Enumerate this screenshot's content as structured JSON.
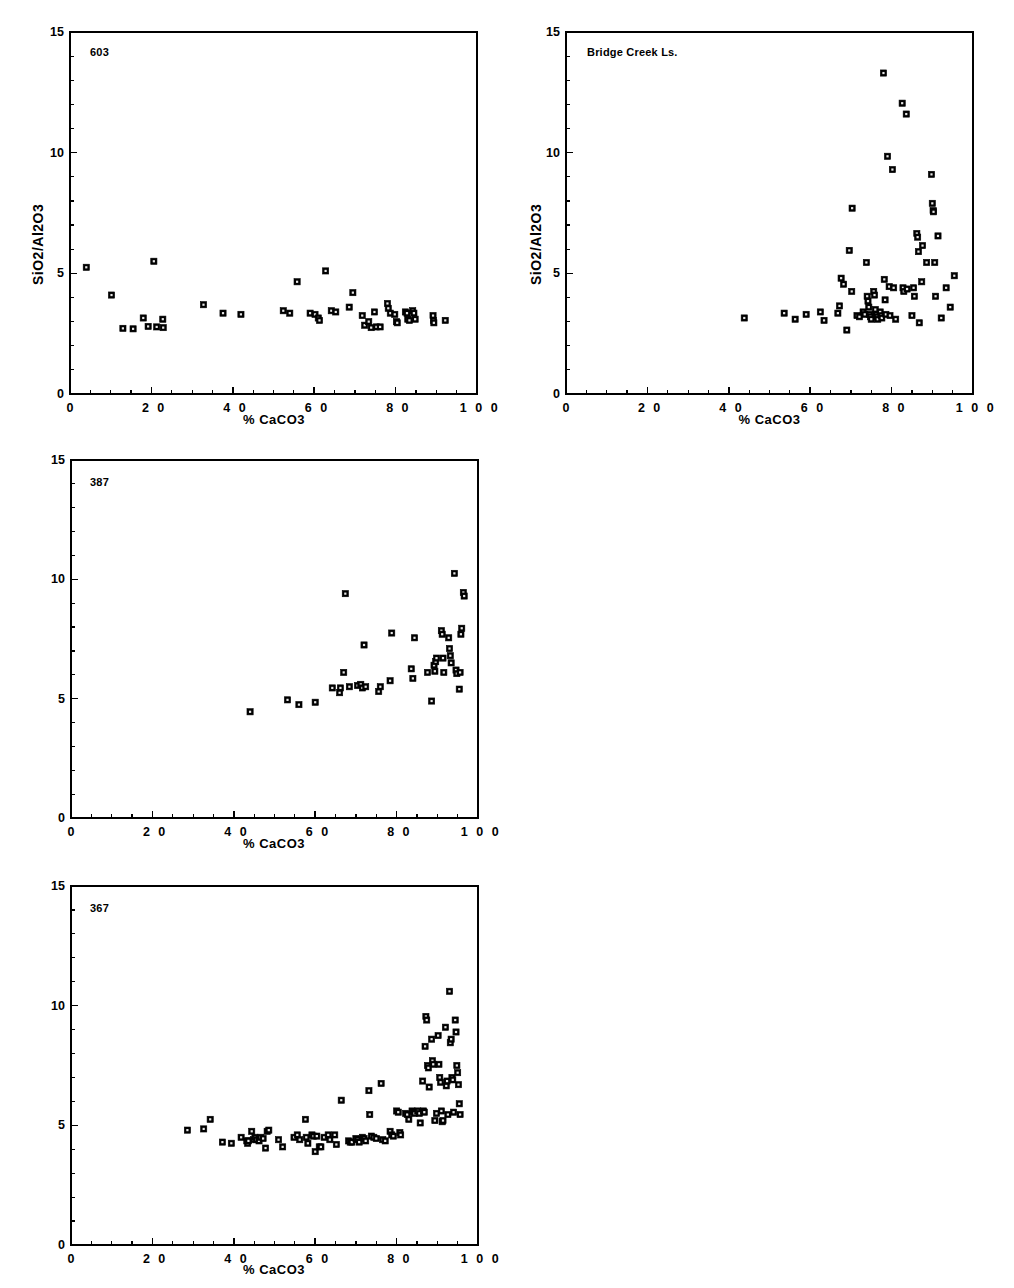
{
  "figure": {
    "background": "#ffffff",
    "marker_color": "#000000",
    "axis_color": "#000000",
    "clipped_top_text": ""
  },
  "axes_common": {
    "xlabel": "% CaCO3",
    "ylabel": "SiO2/Al2O3",
    "xlim": [
      0,
      100
    ],
    "ylim": [
      0,
      15
    ],
    "xticks_major": [
      0,
      20,
      40,
      60,
      80,
      100
    ],
    "xticks_major_labels": [
      "0",
      "2 0",
      "4 0",
      "6 0",
      "8 0",
      "1 0 0"
    ],
    "xtick_minor_step": 5,
    "yticks_major": [
      0,
      5,
      10,
      15
    ],
    "yticks_major_labels": [
      "0",
      "5",
      "10",
      "15"
    ],
    "ytick_minor_step": 1,
    "grid": false,
    "legend": "none"
  },
  "chart_data": [
    {
      "id": "panel-603",
      "type": "scatter",
      "title": "603",
      "xlabel": "% CaCO3",
      "ylabel": "SiO2/Al2O3",
      "xlim": [
        0,
        100
      ],
      "ylim": [
        0,
        15
      ],
      "marker": "square",
      "points": [
        [
          4.0,
          5.25
        ],
        [
          10.2,
          4.1
        ],
        [
          13.0,
          2.72
        ],
        [
          15.5,
          2.7
        ],
        [
          18.0,
          3.15
        ],
        [
          19.2,
          2.8
        ],
        [
          20.6,
          5.5
        ],
        [
          21.3,
          2.78
        ],
        [
          22.8,
          3.1
        ],
        [
          22.9,
          2.75
        ],
        [
          32.8,
          3.7
        ],
        [
          37.6,
          3.35
        ],
        [
          42.0,
          3.3
        ],
        [
          52.4,
          3.45
        ],
        [
          54.0,
          3.35
        ],
        [
          55.8,
          4.65
        ],
        [
          59.0,
          3.35
        ],
        [
          60.2,
          3.3
        ],
        [
          61.0,
          3.15
        ],
        [
          61.3,
          3.05
        ],
        [
          62.8,
          5.1
        ],
        [
          64.2,
          3.45
        ],
        [
          65.3,
          3.4
        ],
        [
          68.6,
          3.6
        ],
        [
          69.5,
          4.2
        ],
        [
          71.8,
          3.25
        ],
        [
          72.4,
          2.85
        ],
        [
          73.4,
          3.0
        ],
        [
          74.0,
          2.75
        ],
        [
          74.8,
          3.4
        ],
        [
          75.3,
          2.78
        ],
        [
          76.2,
          2.78
        ],
        [
          78.0,
          3.75
        ],
        [
          78.2,
          3.55
        ],
        [
          78.7,
          3.35
        ],
        [
          79.8,
          3.3
        ],
        [
          80.2,
          3.0
        ],
        [
          80.4,
          2.95
        ],
        [
          82.4,
          3.4
        ],
        [
          82.8,
          3.35
        ],
        [
          83.0,
          3.1
        ],
        [
          83.4,
          3.05
        ],
        [
          84.2,
          3.45
        ],
        [
          84.5,
          3.35
        ],
        [
          84.8,
          3.1
        ],
        [
          89.2,
          3.25
        ],
        [
          89.3,
          3.05
        ],
        [
          89.4,
          2.95
        ],
        [
          92.2,
          3.05
        ]
      ]
    },
    {
      "id": "panel-bridge-creek",
      "type": "scatter",
      "title": "Bridge Creek Ls.",
      "xlabel": "% CaCO3",
      "ylabel": "SiO2/Al2O3",
      "xlim": [
        0,
        100
      ],
      "ylim": [
        0,
        15
      ],
      "marker": "square",
      "points": [
        [
          43.8,
          3.15
        ],
        [
          53.6,
          3.35
        ],
        [
          56.3,
          3.1
        ],
        [
          59.0,
          3.3
        ],
        [
          62.5,
          3.4
        ],
        [
          63.4,
          3.05
        ],
        [
          66.8,
          3.35
        ],
        [
          67.2,
          3.65
        ],
        [
          67.6,
          4.8
        ],
        [
          68.2,
          4.55
        ],
        [
          69.0,
          2.65
        ],
        [
          69.6,
          5.95
        ],
        [
          70.2,
          4.25
        ],
        [
          70.3,
          7.7
        ],
        [
          71.5,
          3.25
        ],
        [
          72.1,
          3.2
        ],
        [
          73.0,
          3.4
        ],
        [
          73.4,
          3.3
        ],
        [
          73.8,
          5.45
        ],
        [
          74.0,
          4.05
        ],
        [
          74.2,
          3.85
        ],
        [
          74.4,
          3.6
        ],
        [
          74.6,
          3.3
        ],
        [
          74.8,
          3.2
        ],
        [
          75.0,
          3.1
        ],
        [
          75.6,
          4.25
        ],
        [
          75.8,
          4.1
        ],
        [
          76.0,
          3.5
        ],
        [
          76.2,
          3.3
        ],
        [
          76.4,
          3.2
        ],
        [
          76.6,
          3.1
        ],
        [
          77.2,
          3.4
        ],
        [
          77.4,
          3.25
        ],
        [
          77.6,
          3.15
        ],
        [
          78.0,
          13.3
        ],
        [
          78.2,
          4.75
        ],
        [
          78.4,
          3.9
        ],
        [
          78.6,
          3.3
        ],
        [
          79.0,
          9.85
        ],
        [
          79.4,
          4.45
        ],
        [
          79.6,
          3.25
        ],
        [
          80.2,
          9.3
        ],
        [
          80.5,
          4.4
        ],
        [
          81.0,
          3.1
        ],
        [
          82.6,
          12.05
        ],
        [
          82.8,
          4.4
        ],
        [
          83.0,
          4.25
        ],
        [
          83.6,
          11.6
        ],
        [
          83.8,
          4.35
        ],
        [
          85.0,
          3.25
        ],
        [
          85.4,
          4.4
        ],
        [
          85.6,
          4.05
        ],
        [
          86.2,
          6.65
        ],
        [
          86.4,
          6.5
        ],
        [
          86.6,
          5.9
        ],
        [
          86.8,
          2.95
        ],
        [
          87.4,
          4.65
        ],
        [
          87.6,
          6.15
        ],
        [
          88.6,
          5.45
        ],
        [
          89.8,
          9.1
        ],
        [
          90.0,
          7.9
        ],
        [
          90.2,
          7.6
        ],
        [
          90.3,
          7.55
        ],
        [
          90.6,
          5.45
        ],
        [
          90.8,
          4.05
        ],
        [
          91.4,
          6.55
        ],
        [
          92.2,
          3.15
        ],
        [
          93.4,
          4.4
        ],
        [
          94.4,
          3.6
        ],
        [
          95.4,
          4.9
        ]
      ]
    },
    {
      "id": "panel-387",
      "type": "scatter",
      "title": "387",
      "xlabel": "% CaCO3",
      "ylabel": "SiO2/Al2O3",
      "xlim": [
        0,
        100
      ],
      "ylim": [
        0,
        15
      ],
      "marker": "square",
      "points": [
        [
          44.0,
          4.45
        ],
        [
          53.2,
          4.95
        ],
        [
          56.0,
          4.75
        ],
        [
          60.0,
          4.85
        ],
        [
          64.2,
          5.45
        ],
        [
          66.0,
          5.25
        ],
        [
          66.2,
          5.45
        ],
        [
          67.0,
          6.1
        ],
        [
          67.4,
          9.4
        ],
        [
          68.4,
          5.5
        ],
        [
          70.4,
          5.55
        ],
        [
          71.2,
          5.6
        ],
        [
          71.6,
          5.45
        ],
        [
          72.0,
          7.25
        ],
        [
          72.4,
          5.5
        ],
        [
          75.6,
          5.3
        ],
        [
          76.0,
          5.5
        ],
        [
          78.4,
          5.75
        ],
        [
          78.8,
          7.75
        ],
        [
          83.6,
          6.25
        ],
        [
          84.0,
          5.85
        ],
        [
          84.4,
          7.55
        ],
        [
          87.6,
          6.1
        ],
        [
          88.6,
          4.9
        ],
        [
          89.2,
          6.4
        ],
        [
          89.4,
          6.15
        ],
        [
          89.6,
          6.55
        ],
        [
          89.8,
          6.7
        ],
        [
          91.0,
          7.85
        ],
        [
          91.2,
          7.7
        ],
        [
          91.4,
          6.7
        ],
        [
          91.6,
          6.1
        ],
        [
          92.8,
          7.55
        ],
        [
          93.0,
          7.1
        ],
        [
          93.2,
          6.8
        ],
        [
          93.4,
          6.5
        ],
        [
          94.2,
          10.25
        ],
        [
          94.6,
          6.2
        ],
        [
          94.8,
          6.05
        ],
        [
          95.4,
          5.4
        ],
        [
          95.6,
          6.1
        ],
        [
          95.8,
          7.7
        ],
        [
          96.0,
          7.95
        ],
        [
          96.4,
          9.45
        ],
        [
          96.6,
          9.3
        ]
      ]
    },
    {
      "id": "panel-367",
      "type": "scatter",
      "title": "367",
      "xlabel": "% CaCO3",
      "ylabel": "SiO2/Al2O3",
      "xlim": [
        0,
        100
      ],
      "ylim": [
        0,
        15
      ],
      "marker": "square",
      "points": [
        [
          28.6,
          4.8
        ],
        [
          32.6,
          4.85
        ],
        [
          34.2,
          5.25
        ],
        [
          37.2,
          4.3
        ],
        [
          39.4,
          4.25
        ],
        [
          41.8,
          4.5
        ],
        [
          43.2,
          4.35
        ],
        [
          43.4,
          4.25
        ],
        [
          43.6,
          4.35
        ],
        [
          44.4,
          4.75
        ],
        [
          44.8,
          4.4
        ],
        [
          45.2,
          4.5
        ],
        [
          45.6,
          4.4
        ],
        [
          46.2,
          4.35
        ],
        [
          46.6,
          4.5
        ],
        [
          47.2,
          4.45
        ],
        [
          47.8,
          4.05
        ],
        [
          48.2,
          4.75
        ],
        [
          48.6,
          4.8
        ],
        [
          51.0,
          4.4
        ],
        [
          52.0,
          4.1
        ],
        [
          54.8,
          4.5
        ],
        [
          55.6,
          4.6
        ],
        [
          56.2,
          4.4
        ],
        [
          57.6,
          5.25
        ],
        [
          57.8,
          4.5
        ],
        [
          58.2,
          4.25
        ],
        [
          59.2,
          4.6
        ],
        [
          59.6,
          4.55
        ],
        [
          60.0,
          3.9
        ],
        [
          60.4,
          4.55
        ],
        [
          61.0,
          4.1
        ],
        [
          61.4,
          4.1
        ],
        [
          62.2,
          4.5
        ],
        [
          63.2,
          4.6
        ],
        [
          63.6,
          4.4
        ],
        [
          64.8,
          4.6
        ],
        [
          65.2,
          4.2
        ],
        [
          66.4,
          6.05
        ],
        [
          68.2,
          4.35
        ],
        [
          68.6,
          4.3
        ],
        [
          69.0,
          4.3
        ],
        [
          70.0,
          4.45
        ],
        [
          70.4,
          4.4
        ],
        [
          70.8,
          4.3
        ],
        [
          71.6,
          4.5
        ],
        [
          72.0,
          4.45
        ],
        [
          72.4,
          4.35
        ],
        [
          73.2,
          6.45
        ],
        [
          73.4,
          5.45
        ],
        [
          73.8,
          4.55
        ],
        [
          74.4,
          4.5
        ],
        [
          75.0,
          4.45
        ],
        [
          76.2,
          6.75
        ],
        [
          76.6,
          4.4
        ],
        [
          77.2,
          4.35
        ],
        [
          78.4,
          4.75
        ],
        [
          78.8,
          4.6
        ],
        [
          79.2,
          4.55
        ],
        [
          80.0,
          5.6
        ],
        [
          80.4,
          5.55
        ],
        [
          80.8,
          4.7
        ],
        [
          81.0,
          4.6
        ],
        [
          82.2,
          5.5
        ],
        [
          82.6,
          5.45
        ],
        [
          83.0,
          5.25
        ],
        [
          83.8,
          5.6
        ],
        [
          84.2,
          5.55
        ],
        [
          84.4,
          5.5
        ],
        [
          85.2,
          5.6
        ],
        [
          85.6,
          5.5
        ],
        [
          85.8,
          5.1
        ],
        [
          86.4,
          6.85
        ],
        [
          86.6,
          5.6
        ],
        [
          86.8,
          5.55
        ],
        [
          87.0,
          8.3
        ],
        [
          87.2,
          9.55
        ],
        [
          87.4,
          9.4
        ],
        [
          87.6,
          7.5
        ],
        [
          87.8,
          7.4
        ],
        [
          88.0,
          6.6
        ],
        [
          88.6,
          8.6
        ],
        [
          88.8,
          7.7
        ],
        [
          89.0,
          7.55
        ],
        [
          89.4,
          5.2
        ],
        [
          89.8,
          5.5
        ],
        [
          90.2,
          8.75
        ],
        [
          90.4,
          7.55
        ],
        [
          90.6,
          7.0
        ],
        [
          90.8,
          6.8
        ],
        [
          91.0,
          5.6
        ],
        [
          91.2,
          5.15
        ],
        [
          91.4,
          5.2
        ],
        [
          92.0,
          9.1
        ],
        [
          92.2,
          6.65
        ],
        [
          92.4,
          6.85
        ],
        [
          92.6,
          5.45
        ],
        [
          93.0,
          10.6
        ],
        [
          93.2,
          8.45
        ],
        [
          93.4,
          8.6
        ],
        [
          93.6,
          7.0
        ],
        [
          93.8,
          6.9
        ],
        [
          94.0,
          5.55
        ],
        [
          94.4,
          9.4
        ],
        [
          94.6,
          8.9
        ],
        [
          94.8,
          7.5
        ],
        [
          95.0,
          7.2
        ],
        [
          95.2,
          6.7
        ],
        [
          95.4,
          5.9
        ],
        [
          95.6,
          5.45
        ]
      ]
    }
  ],
  "panels": {
    "p1": {
      "tag": "603"
    },
    "p2": {
      "tag": "Bridge Creek Ls."
    },
    "p3": {
      "tag": "387"
    },
    "p4": {
      "tag": "367"
    }
  }
}
